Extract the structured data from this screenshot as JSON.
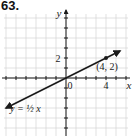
{
  "problem_number": "63.",
  "chart_data": {
    "type": "line",
    "title": "",
    "xlabel": "x",
    "ylabel": "y",
    "xlim": [
      -6,
      6
    ],
    "ylim": [
      -6,
      6
    ],
    "grid": true,
    "x_tick_labels": [
      {
        "value": 4,
        "label": "4"
      }
    ],
    "y_tick_labels": [
      {
        "value": 2,
        "label": "2"
      }
    ],
    "origin_label": "0",
    "series": [
      {
        "name": "y = 1/2 x",
        "label": "y = ½ x",
        "slope": 0.5,
        "intercept": 0,
        "x_range": [
          -6,
          5.4
        ],
        "arrows": "both"
      }
    ],
    "points": [
      {
        "x": 4,
        "y": 2,
        "label": "(4, 2)"
      }
    ],
    "colors": {
      "grid": "#d4d4d4",
      "axis": "#1a1a1a",
      "line": "#1a1a1a"
    }
  }
}
